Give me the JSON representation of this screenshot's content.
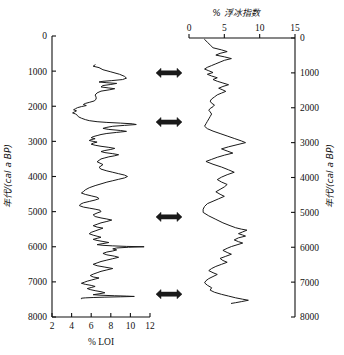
{
  "figure": {
    "title": "",
    "background_color": "#ffffff",
    "line_color": "#1a1a1a"
  },
  "left_panel": {
    "x_axis": {
      "label": "% LOI",
      "ticks": [
        "2",
        "4",
        "6",
        "8",
        "10",
        "12"
      ],
      "min": 2,
      "max": 12
    },
    "y_axis": {
      "label": "年代/(cal a BP)",
      "ticks": [
        "0",
        "1000",
        "2000",
        "3000",
        "4000",
        "5000",
        "6000",
        "7000",
        "8000"
      ],
      "min": 0,
      "max": 8000,
      "inverted": true
    }
  },
  "right_panel": {
    "x_axis": {
      "label": "% 浮冰指数",
      "ticks": [
        "0",
        "5",
        "10",
        "15"
      ],
      "min": 0,
      "max": 15
    },
    "y_axis": {
      "label": "年代/(cal a BP)",
      "ticks": [
        "0",
        "1000",
        "2000",
        "3000",
        "4000",
        "5000",
        "6000",
        "7000",
        "8000"
      ],
      "min": 0,
      "max": 8000,
      "inverted": true
    }
  },
  "correlation_markers": {
    "icon": "double-headed-arrow-icon",
    "count": 4,
    "ages": [
      1050,
      2450,
      5150,
      7350
    ]
  },
  "chart_data": [
    {
      "type": "line",
      "name": "loi",
      "title": "% LOI",
      "xlabel": "% LOI",
      "ylabel": "年代/(cal a BP)",
      "xlim": [
        2,
        12
      ],
      "ylim": [
        0,
        8000
      ],
      "y_inverted": true,
      "grid": false,
      "legend": "none",
      "orientation": "vertical-depth",
      "x_values_are": "% LOI",
      "y_values_are": "cal a BP",
      "points": [
        [
          6.4,
          820
        ],
        [
          6.2,
          860
        ],
        [
          6.8,
          900
        ],
        [
          7.2,
          960
        ],
        [
          8.0,
          1020
        ],
        [
          8.9,
          1090
        ],
        [
          9.4,
          1150
        ],
        [
          9.6,
          1200
        ],
        [
          9.2,
          1240
        ],
        [
          8.1,
          1270
        ],
        [
          7.2,
          1290
        ],
        [
          6.8,
          1310
        ],
        [
          7.6,
          1330
        ],
        [
          8.6,
          1350
        ],
        [
          8.0,
          1380
        ],
        [
          7.2,
          1410
        ],
        [
          7.0,
          1450
        ],
        [
          7.8,
          1480
        ],
        [
          8.4,
          1500
        ],
        [
          7.9,
          1530
        ],
        [
          7.0,
          1570
        ],
        [
          6.6,
          1620
        ],
        [
          6.4,
          1680
        ],
        [
          6.5,
          1740
        ],
        [
          6.5,
          1800
        ],
        [
          6.3,
          1850
        ],
        [
          5.8,
          1890
        ],
        [
          5.4,
          1920
        ],
        [
          5.2,
          1950
        ],
        [
          5.5,
          1980
        ],
        [
          5.0,
          2010
        ],
        [
          4.6,
          2040
        ],
        [
          4.4,
          2070
        ],
        [
          4.2,
          2100
        ],
        [
          4.5,
          2130
        ],
        [
          4.3,
          2160
        ],
        [
          4.1,
          2190
        ],
        [
          4.4,
          2220
        ],
        [
          4.6,
          2260
        ],
        [
          4.7,
          2300
        ],
        [
          5.0,
          2340
        ],
        [
          5.4,
          2380
        ],
        [
          5.8,
          2410
        ],
        [
          6.6,
          2440
        ],
        [
          7.6,
          2460
        ],
        [
          9.0,
          2480
        ],
        [
          10.2,
          2500
        ],
        [
          10.6,
          2520
        ],
        [
          9.4,
          2545
        ],
        [
          8.2,
          2570
        ],
        [
          7.6,
          2600
        ],
        [
          7.2,
          2630
        ],
        [
          7.8,
          2660
        ],
        [
          9.0,
          2690
        ],
        [
          9.6,
          2715
        ],
        [
          8.6,
          2745
        ],
        [
          7.6,
          2775
        ],
        [
          7.0,
          2805
        ],
        [
          6.6,
          2835
        ],
        [
          6.2,
          2865
        ],
        [
          6.0,
          2895
        ],
        [
          6.4,
          2925
        ],
        [
          6.0,
          2950
        ],
        [
          5.8,
          2975
        ],
        [
          6.2,
          3000
        ],
        [
          6.6,
          3020
        ],
        [
          6.2,
          3050
        ],
        [
          6.0,
          3080
        ],
        [
          6.4,
          3110
        ],
        [
          7.0,
          3140
        ],
        [
          7.8,
          3170
        ],
        [
          8.4,
          3200
        ],
        [
          8.0,
          3230
        ],
        [
          7.4,
          3260
        ],
        [
          7.0,
          3290
        ],
        [
          7.4,
          3320
        ],
        [
          8.2,
          3350
        ],
        [
          8.8,
          3380
        ],
        [
          8.4,
          3410
        ],
        [
          7.8,
          3440
        ],
        [
          7.4,
          3470
        ],
        [
          7.0,
          3500
        ],
        [
          6.8,
          3540
        ],
        [
          6.6,
          3580
        ],
        [
          6.9,
          3620
        ],
        [
          7.2,
          3660
        ],
        [
          7.0,
          3700
        ],
        [
          6.8,
          3740
        ],
        [
          7.0,
          3790
        ],
        [
          7.6,
          3840
        ],
        [
          8.2,
          3880
        ],
        [
          8.8,
          3920
        ],
        [
          9.4,
          3960
        ],
        [
          9.7,
          4000
        ],
        [
          9.4,
          4040
        ],
        [
          8.8,
          4080
        ],
        [
          8.2,
          4120
        ],
        [
          7.6,
          4160
        ],
        [
          7.0,
          4210
        ],
        [
          6.4,
          4260
        ],
        [
          5.8,
          4320
        ],
        [
          5.4,
          4380
        ],
        [
          5.2,
          4430
        ],
        [
          5.0,
          4470
        ],
        [
          5.4,
          4510
        ],
        [
          6.0,
          4550
        ],
        [
          6.6,
          4590
        ],
        [
          6.8,
          4630
        ],
        [
          6.4,
          4670
        ],
        [
          5.8,
          4710
        ],
        [
          5.2,
          4750
        ],
        [
          4.9,
          4790
        ],
        [
          4.8,
          4830
        ],
        [
          5.2,
          4870
        ],
        [
          5.8,
          4900
        ],
        [
          6.4,
          4930
        ],
        [
          6.9,
          4960
        ],
        [
          7.0,
          5000
        ],
        [
          6.6,
          5040
        ],
        [
          6.2,
          5090
        ],
        [
          6.4,
          5140
        ],
        [
          7.0,
          5180
        ],
        [
          7.6,
          5210
        ],
        [
          8.1,
          5240
        ],
        [
          7.6,
          5280
        ],
        [
          7.0,
          5320
        ],
        [
          6.6,
          5360
        ],
        [
          6.2,
          5400
        ],
        [
          6.6,
          5440
        ],
        [
          7.2,
          5470
        ],
        [
          6.8,
          5510
        ],
        [
          6.4,
          5550
        ],
        [
          6.0,
          5590
        ],
        [
          5.8,
          5630
        ],
        [
          6.2,
          5670
        ],
        [
          6.6,
          5700
        ],
        [
          7.0,
          5730
        ],
        [
          6.6,
          5760
        ],
        [
          6.2,
          5790
        ],
        [
          6.6,
          5820
        ],
        [
          7.2,
          5850
        ],
        [
          7.8,
          5880
        ],
        [
          7.2,
          5910
        ],
        [
          6.6,
          5940
        ],
        [
          7.2,
          5960
        ],
        [
          8.2,
          5975
        ],
        [
          9.6,
          5990
        ],
        [
          11.4,
          6000
        ],
        [
          9.8,
          6015
        ],
        [
          8.6,
          6035
        ],
        [
          8.2,
          6060
        ],
        [
          8.6,
          6090
        ],
        [
          8.2,
          6120
        ],
        [
          7.6,
          6150
        ],
        [
          7.2,
          6190
        ],
        [
          7.6,
          6230
        ],
        [
          8.4,
          6270
        ],
        [
          8.8,
          6300
        ],
        [
          8.2,
          6340
        ],
        [
          7.6,
          6380
        ],
        [
          7.0,
          6420
        ],
        [
          6.6,
          6460
        ],
        [
          6.2,
          6500
        ],
        [
          6.6,
          6540
        ],
        [
          7.4,
          6580
        ],
        [
          8.2,
          6620
        ],
        [
          7.6,
          6660
        ],
        [
          7.0,
          6700
        ],
        [
          6.6,
          6740
        ],
        [
          6.2,
          6780
        ],
        [
          5.9,
          6820
        ],
        [
          6.2,
          6860
        ],
        [
          6.8,
          6890
        ],
        [
          6.4,
          6920
        ],
        [
          6.0,
          6950
        ],
        [
          5.6,
          6980
        ],
        [
          5.3,
          7010
        ],
        [
          5.0,
          7040
        ],
        [
          5.4,
          7070
        ],
        [
          6.0,
          7100
        ],
        [
          6.4,
          7130
        ],
        [
          6.0,
          7160
        ],
        [
          5.6,
          7190
        ],
        [
          5.9,
          7220
        ],
        [
          6.4,
          7250
        ],
        [
          7.0,
          7280
        ],
        [
          7.4,
          7310
        ],
        [
          6.8,
          7340
        ],
        [
          6.2,
          7365
        ],
        [
          7.0,
          7380
        ],
        [
          8.4,
          7395
        ],
        [
          9.6,
          7405
        ],
        [
          10.4,
          7415
        ],
        [
          9.0,
          7425
        ],
        [
          7.4,
          7435
        ],
        [
          6.2,
          7445
        ],
        [
          5.4,
          7455
        ],
        [
          5.0,
          7465
        ],
        [
          5.0,
          7480
        ]
      ]
    },
    {
      "type": "line",
      "name": "ice_rafting_index",
      "title": "% 浮冰指数",
      "xlabel": "% 浮冰指数",
      "ylabel": "年代/(cal a BP)",
      "xlim": [
        0,
        15
      ],
      "ylim": [
        0,
        8000
      ],
      "y_inverted": true,
      "grid": false,
      "legend": "none",
      "orientation": "vertical-depth",
      "x_values_are": "% ice-rafting index",
      "y_values_are": "cal a BP",
      "points": [
        [
          2.2,
          40
        ],
        [
          2.6,
          120
        ],
        [
          3.0,
          200
        ],
        [
          3.4,
          280
        ],
        [
          4.6,
          340
        ],
        [
          5.4,
          390
        ],
        [
          4.4,
          440
        ],
        [
          3.8,
          490
        ],
        [
          5.0,
          540
        ],
        [
          6.0,
          590
        ],
        [
          5.0,
          640
        ],
        [
          4.4,
          690
        ],
        [
          3.8,
          740
        ],
        [
          3.2,
          790
        ],
        [
          2.6,
          840
        ],
        [
          2.2,
          890
        ],
        [
          2.8,
          940
        ],
        [
          3.4,
          990
        ],
        [
          2.6,
          1040
        ],
        [
          3.2,
          1090
        ],
        [
          4.0,
          1140
        ],
        [
          3.4,
          1190
        ],
        [
          4.0,
          1240
        ],
        [
          4.8,
          1290
        ],
        [
          5.6,
          1340
        ],
        [
          4.8,
          1390
        ],
        [
          4.2,
          1440
        ],
        [
          4.8,
          1490
        ],
        [
          5.2,
          1530
        ],
        [
          4.6,
          1580
        ],
        [
          4.0,
          1630
        ],
        [
          3.6,
          1690
        ],
        [
          3.2,
          1750
        ],
        [
          3.0,
          1810
        ],
        [
          3.2,
          1870
        ],
        [
          3.6,
          1920
        ],
        [
          3.4,
          1970
        ],
        [
          3.0,
          2020
        ],
        [
          2.8,
          2070
        ],
        [
          3.0,
          2120
        ],
        [
          3.2,
          2180
        ],
        [
          3.0,
          2250
        ],
        [
          2.8,
          2320
        ],
        [
          2.6,
          2390
        ],
        [
          2.4,
          2460
        ],
        [
          2.2,
          2530
        ],
        [
          2.6,
          2600
        ],
        [
          3.4,
          2670
        ],
        [
          4.4,
          2740
        ],
        [
          5.4,
          2810
        ],
        [
          6.4,
          2880
        ],
        [
          7.4,
          2950
        ],
        [
          8.0,
          3000
        ],
        [
          6.8,
          3060
        ],
        [
          5.6,
          3120
        ],
        [
          4.6,
          3180
        ],
        [
          5.4,
          3240
        ],
        [
          6.2,
          3300
        ],
        [
          5.0,
          3360
        ],
        [
          4.0,
          3420
        ],
        [
          3.2,
          3480
        ],
        [
          2.4,
          3540
        ],
        [
          3.4,
          3620
        ],
        [
          4.6,
          3700
        ],
        [
          5.6,
          3780
        ],
        [
          6.4,
          3850
        ],
        [
          5.4,
          3920
        ],
        [
          4.6,
          3990
        ],
        [
          4.0,
          4060
        ],
        [
          4.6,
          4130
        ],
        [
          5.4,
          4200
        ],
        [
          5.0,
          4270
        ],
        [
          4.4,
          4340
        ],
        [
          3.8,
          4410
        ],
        [
          4.4,
          4480
        ],
        [
          5.0,
          4540
        ],
        [
          4.2,
          4610
        ],
        [
          3.4,
          4680
        ],
        [
          2.6,
          4750
        ],
        [
          2.2,
          4830
        ],
        [
          2.0,
          4910
        ],
        [
          2.0,
          5000
        ],
        [
          2.8,
          5100
        ],
        [
          3.8,
          5200
        ],
        [
          4.8,
          5300
        ],
        [
          5.8,
          5380
        ],
        [
          6.6,
          5440
        ],
        [
          7.4,
          5480
        ],
        [
          8.2,
          5510
        ],
        [
          7.6,
          5560
        ],
        [
          7.0,
          5610
        ],
        [
          7.6,
          5650
        ],
        [
          8.0,
          5680
        ],
        [
          7.0,
          5730
        ],
        [
          6.4,
          5790
        ],
        [
          7.0,
          5840
        ],
        [
          7.6,
          5880
        ],
        [
          6.8,
          5930
        ],
        [
          6.0,
          5980
        ],
        [
          5.4,
          6030
        ],
        [
          4.8,
          6090
        ],
        [
          5.4,
          6150
        ],
        [
          6.0,
          6200
        ],
        [
          5.2,
          6260
        ],
        [
          4.4,
          6320
        ],
        [
          4.8,
          6380
        ],
        [
          5.4,
          6430
        ],
        [
          4.6,
          6490
        ],
        [
          3.8,
          6550
        ],
        [
          3.2,
          6610
        ],
        [
          2.8,
          6670
        ],
        [
          3.4,
          6730
        ],
        [
          4.0,
          6780
        ],
        [
          3.4,
          6840
        ],
        [
          2.8,
          6900
        ],
        [
          2.4,
          6960
        ],
        [
          2.2,
          7020
        ],
        [
          2.6,
          7090
        ],
        [
          3.2,
          7160
        ],
        [
          3.0,
          7230
        ],
        [
          3.6,
          7290
        ],
        [
          4.6,
          7350
        ],
        [
          5.6,
          7400
        ],
        [
          6.6,
          7450
        ],
        [
          7.6,
          7490
        ],
        [
          8.4,
          7520
        ],
        [
          7.4,
          7560
        ],
        [
          6.6,
          7590
        ],
        [
          6.0,
          7610
        ]
      ]
    }
  ]
}
